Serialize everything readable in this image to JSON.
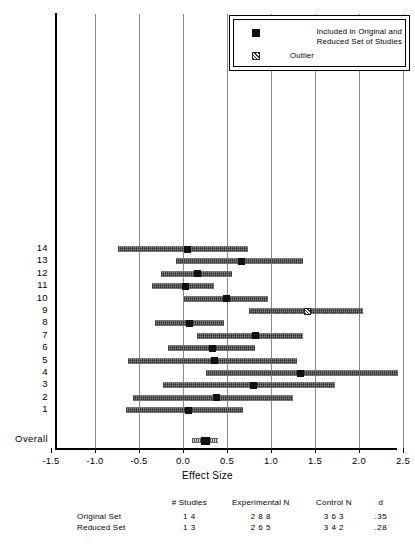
{
  "chart_data": {
    "type": "scatter",
    "title": "",
    "xlabel": "Effect Size",
    "ylabel": "",
    "xlim": [
      -1.5,
      2.5
    ],
    "xticks": [
      -1.5,
      -1.0,
      -0.5,
      0.0,
      0.5,
      1.0,
      1.5,
      2.0,
      2.5
    ],
    "xticklabels": [
      "-1.5",
      "-1.0",
      "-0.5",
      "0.0",
      "0.5",
      "1.0",
      "1.5",
      "2.0",
      "2.5"
    ],
    "grid": true,
    "legend_position": "top-right",
    "series": [
      {
        "name": "Included in Original and Reduced Set of Studies",
        "marker": "filled-square",
        "points": [
          {
            "label": "14",
            "d": 0.05,
            "ci_low": -0.74,
            "ci_high": 0.74,
            "outlier": false
          },
          {
            "label": "13",
            "d": 0.67,
            "ci_low": -0.08,
            "ci_high": 1.36,
            "outlier": false
          },
          {
            "label": "12",
            "d": 0.16,
            "ci_low": -0.25,
            "ci_high": 0.56,
            "outlier": false
          },
          {
            "label": "11",
            "d": 0.03,
            "ci_low": -0.35,
            "ci_high": 0.35,
            "outlier": false
          },
          {
            "label": "10",
            "d": 0.49,
            "ci_low": 0.01,
            "ci_high": 0.97,
            "outlier": false
          },
          {
            "label": "9",
            "d": 1.41,
            "ci_low": 0.75,
            "ci_high": 2.05,
            "outlier": true
          },
          {
            "label": "8",
            "d": 0.07,
            "ci_low": -0.32,
            "ci_high": 0.47,
            "outlier": false
          },
          {
            "label": "7",
            "d": 0.82,
            "ci_low": 0.16,
            "ci_high": 1.36,
            "outlier": false
          },
          {
            "label": "6",
            "d": 0.34,
            "ci_low": -0.17,
            "ci_high": 0.82,
            "outlier": false
          },
          {
            "label": "5",
            "d": 0.36,
            "ci_low": -0.63,
            "ci_high": 1.3,
            "outlier": false
          },
          {
            "label": "4",
            "d": 1.33,
            "ci_low": 0.26,
            "ci_high": 2.44,
            "outlier": false
          },
          {
            "label": "3",
            "d": 0.8,
            "ci_low": -0.23,
            "ci_high": 1.73,
            "outlier": false
          },
          {
            "label": "2",
            "d": 0.38,
            "ci_low": -0.57,
            "ci_high": 1.25,
            "outlier": false
          },
          {
            "label": "1",
            "d": 0.06,
            "ci_low": -0.65,
            "ci_high": 0.68,
            "outlier": false
          }
        ]
      },
      {
        "name": "Overall",
        "marker": "filled-square",
        "points": [
          {
            "label": "Overall",
            "d": 0.25,
            "ci_low": 0.1,
            "ci_high": 0.4,
            "outlier": false
          }
        ]
      }
    ]
  },
  "legend": {
    "items": [
      {
        "swatch": "filled-square",
        "label": "Included in Original and\nReduced Set of Studies"
      },
      {
        "swatch": "hatched-square",
        "label": "Outlier"
      }
    ]
  },
  "summary": {
    "headers": [
      "",
      "# Studies",
      "Experimental N",
      "Control N",
      "d"
    ],
    "rows": [
      {
        "name": "Original Set",
        "studies": "1 4",
        "experimental_n": "2 8 8",
        "control_n": "3 6 3",
        "d": ".35"
      },
      {
        "name": "Reduced Set",
        "studies": "1 3",
        "experimental_n": "2 6 5",
        "control_n": "3 4 2",
        "d": ".28"
      }
    ]
  }
}
